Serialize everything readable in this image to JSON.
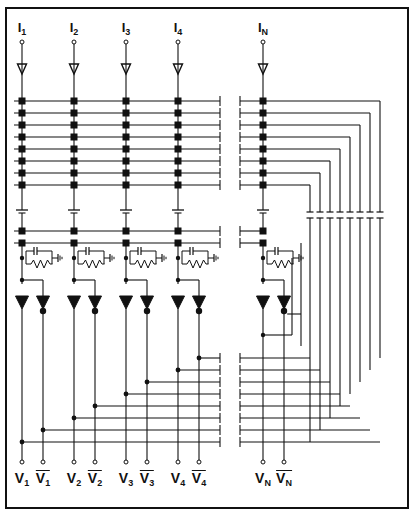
{
  "figure": {
    "type": "circuit-schematic",
    "background": "#ffffff",
    "ink": "#111111",
    "border_color": "#111111"
  },
  "inputs": {
    "label_prefix": "I",
    "items": [
      {
        "id": "I1",
        "base": "I",
        "sub": "1",
        "x": 22
      },
      {
        "id": "I2",
        "base": "I",
        "sub": "2",
        "x": 74
      },
      {
        "id": "I3",
        "base": "I",
        "sub": "3",
        "x": 126
      },
      {
        "id": "I4",
        "base": "I",
        "sub": "4",
        "x": 178
      },
      {
        "id": "IN",
        "base": "I",
        "sub": "N",
        "x": 263
      }
    ]
  },
  "outputs": {
    "items": [
      {
        "id": "V1",
        "base": "V",
        "sub": "1",
        "overbar": false,
        "x": 22
      },
      {
        "id": "V1b",
        "base": "V",
        "sub": "1",
        "overbar": true,
        "x": 43
      },
      {
        "id": "V2",
        "base": "V",
        "sub": "2",
        "overbar": false,
        "x": 74
      },
      {
        "id": "V2b",
        "base": "V",
        "sub": "2",
        "overbar": true,
        "x": 95
      },
      {
        "id": "V3",
        "base": "V",
        "sub": "3",
        "overbar": false,
        "x": 126
      },
      {
        "id": "V3b",
        "base": "V",
        "sub": "3",
        "overbar": true,
        "x": 147
      },
      {
        "id": "V4",
        "base": "V",
        "sub": "4",
        "overbar": false,
        "x": 178
      },
      {
        "id": "V4b",
        "base": "V",
        "sub": "4",
        "overbar": true,
        "x": 199
      },
      {
        "id": "VN",
        "base": "V",
        "sub": "N",
        "overbar": false,
        "x": 263
      },
      {
        "id": "VNb",
        "base": "V",
        "sub": "N",
        "overbar": true,
        "x": 284
      }
    ]
  },
  "grid": {
    "column_x": [
      22,
      74,
      126,
      178,
      263
    ],
    "matrix_row_y": [
      101,
      113,
      125,
      137,
      149,
      161,
      173,
      185
    ],
    "lower_row_y": [
      231,
      243
    ],
    "node_size": 7,
    "node_count_per_row": 5,
    "matrix_row_count": 8
  },
  "break_marks": {
    "left_x": 222,
    "right_x": 238,
    "description": "ellipsis break between column 4 and column N"
  },
  "right_bus": {
    "x_positions": [
      310,
      320,
      330,
      340,
      350,
      360,
      370,
      380
    ],
    "count": 8,
    "top_y": 206,
    "bottom_y": 430
  },
  "components": {
    "rc_network": {
      "count": 5,
      "label": "parallel RC to ground",
      "y": 258
    },
    "drivers": {
      "count": 10,
      "label": "triangle buffer",
      "y": 300
    },
    "ground_symbols": {
      "count": 5,
      "y": 214
    },
    "source_terminals": {
      "count": 5,
      "y": 42
    },
    "arrow_heads": {
      "count": 5,
      "y": 70
    }
  },
  "legend": {
    "node": "square matrix junction",
    "dot": "wire junction dot",
    "open_circle": "terminal"
  }
}
